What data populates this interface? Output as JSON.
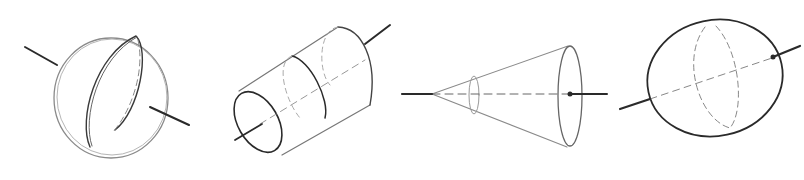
{
  "title": "Pencil sketches of basic 3D forms with axes",
  "colors": {
    "background": "#ffffff",
    "dark_line": "#2a2a2a",
    "mid_line": "#555555",
    "light_line": "#9a9a9a"
  },
  "figures": [
    {
      "name": "sphere",
      "label": "Sphere with axis"
    },
    {
      "name": "cylinder",
      "label": "Cylinder with axis"
    },
    {
      "name": "cone",
      "label": "Cone with axis"
    },
    {
      "name": "ellipsoid",
      "label": "Ellipsoid with axis"
    }
  ]
}
